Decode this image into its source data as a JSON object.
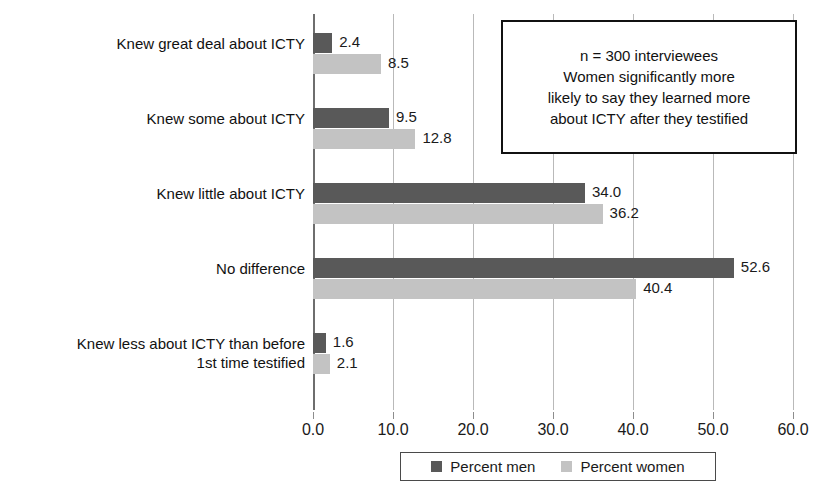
{
  "chart_data": {
    "type": "bar",
    "orientation": "horizontal",
    "title": "",
    "xlabel": "",
    "ylabel": "",
    "xlim": [
      0.0,
      60.0
    ],
    "xticks": [
      "0.0",
      "10.0",
      "20.0",
      "30.0",
      "40.0",
      "50.0",
      "60.0"
    ],
    "xtick_values": [
      0,
      10,
      20,
      30,
      40,
      50,
      60
    ],
    "grid": true,
    "legend_position": "bottom",
    "categories": [
      "Knew great deal about ICTY",
      "Knew some about ICTY",
      "Knew little about ICTY",
      "No difference",
      "Knew less about ICTY than before\n1st time testified"
    ],
    "series": [
      {
        "name": "Percent men",
        "color": "#595959",
        "values": [
          2.4,
          9.5,
          34.0,
          52.6,
          1.6
        ],
        "value_labels": [
          "2.4",
          "9.5",
          "34.0",
          "52.6",
          "1.6"
        ]
      },
      {
        "name": "Percent women",
        "color": "#c3c3c3",
        "values": [
          8.5,
          12.8,
          36.2,
          40.4,
          2.1
        ],
        "value_labels": [
          "8.5",
          "12.8",
          "36.2",
          "40.4",
          "2.1"
        ]
      }
    ],
    "annotations": [
      {
        "name": "sample-note",
        "text": "n = 300 interviewees\nWomen significantly more\nlikely to say they learned more\nabout ICTY after they testified"
      }
    ]
  },
  "legend": {
    "entries": [
      {
        "label": "Percent men",
        "color": "#595959"
      },
      {
        "label": "Percent women",
        "color": "#c3c3c3"
      }
    ]
  },
  "colors": {
    "men": "#595959",
    "women": "#c3c3c3",
    "grid": "#b9b9b9",
    "axis": "#6e6e6e",
    "text": "#1a1a1a",
    "background": "#ffffff"
  }
}
